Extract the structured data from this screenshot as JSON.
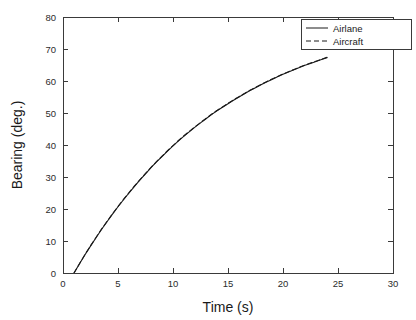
{
  "chart_data": {
    "type": "line",
    "title": "",
    "xlabel": "Time (s)",
    "ylabel": "Bearing (deg.)",
    "xlim": [
      0,
      30
    ],
    "ylim": [
      0,
      80
    ],
    "xticks": [
      0,
      5,
      10,
      15,
      20,
      25,
      30
    ],
    "yticks": [
      0,
      10,
      20,
      30,
      40,
      50,
      60,
      70,
      80
    ],
    "xticklabels": [
      "0",
      "5",
      "10",
      "15",
      "20",
      "25",
      "30"
    ],
    "yticklabels": [
      "0",
      "10",
      "20",
      "30",
      "40",
      "50",
      "60",
      "70",
      "80"
    ],
    "grid": false,
    "legend_position": "upper right",
    "box": true,
    "tick_direction": "in",
    "series": [
      {
        "name": "Airlane",
        "style": "solid",
        "color": "#1a1a1a",
        "x": [
          1.0,
          1.5,
          2.0,
          2.5,
          3.0,
          3.5,
          4.0,
          4.5,
          5.0,
          5.5,
          6.0,
          6.5,
          7.0,
          7.5,
          8.0,
          8.5,
          9.0,
          9.5,
          10.0,
          10.5,
          11.0,
          11.5,
          12.0,
          12.5,
          13.0,
          13.5,
          14.0,
          14.5,
          15.0,
          15.5,
          16.0,
          16.5,
          17.0,
          17.5,
          18.0,
          18.5,
          19.0,
          19.5,
          20.0,
          20.5,
          21.0,
          21.5,
          22.0,
          22.5,
          23.0,
          23.5,
          24.0
        ],
        "y": [
          0.0,
          2.9,
          5.7,
          8.4,
          11.0,
          13.6,
          16.0,
          18.4,
          20.7,
          22.9,
          25.0,
          27.1,
          29.1,
          31.0,
          32.9,
          34.7,
          36.4,
          38.1,
          39.7,
          41.3,
          42.8,
          44.2,
          45.6,
          46.9,
          48.2,
          49.5,
          50.7,
          51.8,
          52.9,
          54.0,
          55.0,
          56.0,
          57.0,
          57.9,
          58.8,
          59.7,
          60.5,
          61.3,
          62.1,
          62.8,
          63.5,
          64.2,
          64.9,
          65.5,
          66.1,
          66.7,
          67.3
        ]
      },
      {
        "name": "Aircraft",
        "style": "dashed",
        "color": "#1a1a1a",
        "x": [
          1.0,
          1.5,
          2.0,
          2.5,
          3.0,
          3.5,
          4.0,
          4.5,
          5.0,
          5.5,
          6.0,
          6.5,
          7.0,
          7.5,
          8.0,
          8.5,
          9.0,
          9.5,
          10.0,
          10.5,
          11.0,
          11.5,
          12.0,
          12.5,
          13.0,
          13.5,
          14.0,
          14.5,
          15.0,
          15.5,
          16.0,
          16.5,
          17.0,
          17.5,
          18.0,
          18.5,
          19.0,
          19.5,
          20.0,
          20.5,
          21.0,
          21.5,
          22.0,
          22.5,
          23.0,
          23.5,
          24.0
        ],
        "y": [
          0.0,
          2.9,
          5.8,
          8.5,
          11.1,
          13.7,
          16.1,
          18.5,
          20.8,
          23.0,
          25.1,
          27.2,
          29.2,
          31.1,
          33.0,
          34.8,
          36.5,
          38.2,
          39.8,
          41.4,
          42.9,
          44.3,
          45.7,
          47.0,
          48.3,
          49.6,
          50.8,
          51.9,
          53.0,
          54.1,
          55.1,
          56.1,
          57.1,
          58.0,
          58.9,
          59.8,
          60.6,
          61.4,
          62.2,
          62.9,
          63.6,
          64.3,
          65.0,
          65.6,
          66.2,
          66.8,
          67.4
        ]
      }
    ]
  },
  "legend": {
    "entries": [
      {
        "label": "Airlane",
        "style": "solid"
      },
      {
        "label": "Aircraft",
        "style": "dashed"
      }
    ]
  },
  "colors": {
    "axis": "#3a3a3a",
    "text": "#1a1a1a",
    "line": "#1a1a1a",
    "background": "#ffffff"
  }
}
